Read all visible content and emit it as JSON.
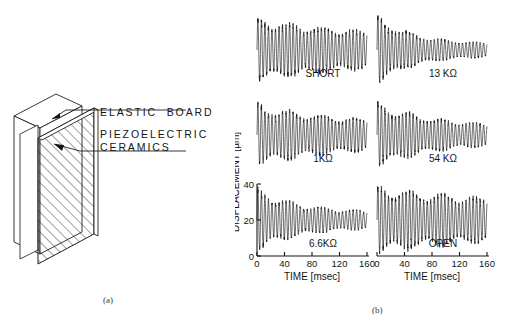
{
  "figure": {
    "panel_a_caption": "(a)",
    "panel_b_caption": "(b)",
    "labels": {
      "elastic_board": "ELASTIC  BOARD",
      "piezoelectric_line1": "PIEZOELECTRIC",
      "piezoelectric_line2": "CERAMICS"
    }
  },
  "chart_data": {
    "type": "line",
    "title": "",
    "xlabel": "TIME [msec]",
    "ylabel": "DISPLACEMENT [µm]",
    "xlim": [
      0,
      160
    ],
    "ylim": [
      0,
      40
    ],
    "xticks": [
      0,
      40,
      80,
      120,
      160
    ],
    "xtick_labels": [
      "0",
      "40",
      "80",
      "120",
      "160"
    ],
    "yticks": [
      0,
      20,
      40
    ],
    "ytick_labels": [
      "0",
      "20",
      "40"
    ],
    "grid": false,
    "legend": "none",
    "shared_y_axis_panel": "6.6KΩ",
    "annotation_note": "Damped free-vibration decay of a piezoelectric bimorph shunted through different resistive loads.",
    "series": [
      {
        "name": "SHORT",
        "label": "SHORT",
        "row": 0,
        "col": 0,
        "carrier_hz": 195,
        "beat_hz": 21,
        "beat_depth": 0.3,
        "initial_amplitude": 17.5,
        "final_amplitude": 7.2,
        "decay_tau_ms": 150,
        "mean_level": 20,
        "y_axis_shown": false,
        "x_axis_shown": false
      },
      {
        "name": "13K",
        "label": "13 KΩ",
        "row": 0,
        "col": 1,
        "carrier_hz": 195,
        "beat_hz": 21,
        "beat_depth": 0.26,
        "initial_amplitude": 19.0,
        "final_amplitude": 3.4,
        "decay_tau_ms": 52,
        "mean_level": 20,
        "y_axis_shown": false,
        "x_axis_shown": false
      },
      {
        "name": "1K",
        "label": "1KΩ",
        "row": 1,
        "col": 0,
        "carrier_hz": 195,
        "beat_hz": 21,
        "beat_depth": 0.3,
        "initial_amplitude": 17.0,
        "final_amplitude": 6.0,
        "decay_tau_ms": 120,
        "mean_level": 20,
        "y_axis_shown": false,
        "x_axis_shown": false
      },
      {
        "name": "54K",
        "label": "54 KΩ",
        "row": 1,
        "col": 1,
        "carrier_hz": 195,
        "beat_hz": 21,
        "beat_depth": 0.28,
        "initial_amplitude": 18.0,
        "final_amplitude": 4.6,
        "decay_tau_ms": 80,
        "mean_level": 20,
        "y_axis_shown": false,
        "x_axis_shown": false
      },
      {
        "name": "6.6K",
        "label": "6.6KΩ",
        "row": 2,
        "col": 0,
        "carrier_hz": 195,
        "beat_hz": 21,
        "beat_depth": 0.3,
        "initial_amplitude": 17.5,
        "final_amplitude": 4.2,
        "decay_tau_ms": 62,
        "mean_level": 20,
        "y_axis_shown": true,
        "x_axis_shown": true
      },
      {
        "name": "OPEN",
        "label": "OPEN",
        "row": 2,
        "col": 1,
        "carrier_hz": 195,
        "beat_hz": 21,
        "beat_depth": 0.32,
        "initial_amplitude": 18.5,
        "final_amplitude": 8.0,
        "decay_tau_ms": 185,
        "mean_level": 20,
        "y_axis_shown": false,
        "x_axis_shown": true
      }
    ]
  }
}
